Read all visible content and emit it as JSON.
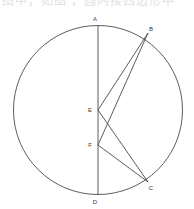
{
  "canvas": {
    "width": 194,
    "height": 209,
    "background": "#ffffff"
  },
  "header": {
    "clipped_text": "图中，如图 ，圆内接四边形中"
  },
  "figure": {
    "stroke_color": "#4a4a4a",
    "label_color": "#3a3a3a",
    "circle": {
      "cx": 98,
      "cy": 110,
      "r": 84.5
    },
    "points": [
      {
        "id": "A",
        "label": "A",
        "x": 98,
        "y": 25.5,
        "label_x": 95,
        "label_y": 21
      },
      {
        "id": "B",
        "label": "B",
        "x": 148,
        "y": 33,
        "label_x": 150,
        "label_y": 31
      },
      {
        "id": "C",
        "label": "C",
        "x": 148,
        "y": 182,
        "label_x": 150,
        "label_y": 189
      },
      {
        "id": "D",
        "label": "D",
        "x": 98,
        "y": 194.5,
        "label_x": 95,
        "label_y": 203
      },
      {
        "id": "E",
        "label": "E",
        "x": 98,
        "y": 110,
        "label_x": 89,
        "label_y": 112
      },
      {
        "id": "F",
        "label": "F",
        "x": 98,
        "y": 145,
        "label_x": 89,
        "label_y": 147
      }
    ],
    "segments": [
      {
        "id": "AD",
        "from": "A",
        "to": "D",
        "x1": 98,
        "y1": 25.5,
        "x2": 98,
        "y2": 194.5
      },
      {
        "id": "EB",
        "from": "E",
        "to": "B",
        "x1": 98,
        "y1": 110,
        "x2": 148,
        "y2": 33
      },
      {
        "id": "EC",
        "from": "E",
        "to": "C",
        "x1": 98,
        "y1": 110,
        "x2": 148,
        "y2": 182
      },
      {
        "id": "FB",
        "from": "F",
        "to": "B",
        "x1": 98,
        "y1": 145,
        "x2": 148,
        "y2": 33
      },
      {
        "id": "FC",
        "from": "F",
        "to": "C",
        "x1": 98,
        "y1": 145,
        "x2": 148,
        "y2": 182
      }
    ]
  }
}
